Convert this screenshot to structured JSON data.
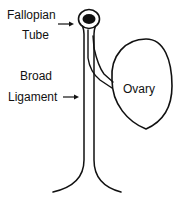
{
  "diagram": {
    "labels": {
      "fallopian_line1": "Fallopian",
      "fallopian_line2": "Tube",
      "broad_line1": "Broad",
      "broad_line2": "Ligament",
      "ovary": "Ovary"
    },
    "arrows": [
      {
        "from_label": "Fallopian Tube",
        "points_to": "tube lumen",
        "glyph": "→"
      },
      {
        "from_label": "Broad Ligament",
        "points_to": "ligament stalk",
        "glyph": "→"
      }
    ],
    "colors": {
      "stroke": "#111111",
      "fill_lumen": "#111111",
      "background": "#ffffff"
    }
  }
}
